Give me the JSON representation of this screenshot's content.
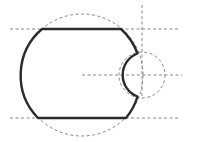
{
  "diagram": {
    "title": "",
    "colors": {
      "outline": "#2b2b2b",
      "construction": "#7a7a7a",
      "background": "#ffffff"
    },
    "large_circle": {
      "cx": 82,
      "cy": 75,
      "r": 61
    },
    "small_circle": {
      "cx": 142,
      "cy": 75,
      "r": 23
    },
    "guide_lines": {
      "top_horizontal": {
        "x1": 10,
        "y1": 29,
        "x2": 178,
        "y2": 29
      },
      "bottom_horizontal": {
        "x1": 10,
        "y1": 118,
        "x2": 178,
        "y2": 118
      },
      "center_horizontal": {
        "x1": 82,
        "y1": 75,
        "x2": 182,
        "y2": 75
      },
      "vertical": {
        "x1": 142,
        "y1": 5,
        "x2": 142,
        "y2": 99
      }
    },
    "profile_path": "M 42 29 L 121 29 A 61 61 0 0 1 137.5 53.5 A 23 23 0 0 0 137.5 96.5 A 61 61 0 0 1 126 118 L 38 118 A 61 61 0 0 1 42 29 Z"
  }
}
